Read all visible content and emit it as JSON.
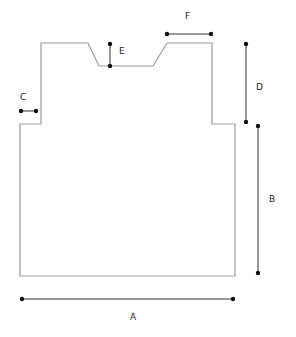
{
  "diagram": {
    "type": "garment schematic",
    "colors": {
      "outline": "#9a9a9a",
      "dimension": "#333333",
      "dot": "#111111"
    },
    "outline_points": [
      [
        41,
        43
      ],
      [
        88,
        43
      ],
      [
        99,
        66
      ],
      [
        153,
        66
      ],
      [
        167,
        43
      ],
      [
        212,
        43
      ],
      [
        212,
        124
      ],
      [
        235,
        124
      ],
      [
        235,
        276
      ],
      [
        20,
        276
      ],
      [
        20,
        124
      ],
      [
        41,
        124
      ]
    ],
    "dimensions": [
      {
        "id": "A",
        "label": "A",
        "x1": 22,
        "y1": 299,
        "x2": 233,
        "y2": 299,
        "lx": 130,
        "ly": 313
      },
      {
        "id": "B",
        "label": "B",
        "x1": 258,
        "y1": 126,
        "x2": 258,
        "y2": 273,
        "lx": 269,
        "ly": 195
      },
      {
        "id": "C",
        "label": "C",
        "x1": 21,
        "y1": 111,
        "x2": 36,
        "y2": 111,
        "lx": 20,
        "ly": 93
      },
      {
        "id": "D",
        "label": "D",
        "x1": 246,
        "y1": 44,
        "x2": 246,
        "y2": 122,
        "lx": 256,
        "ly": 83
      },
      {
        "id": "E",
        "label": "E",
        "x1": 110,
        "y1": 44,
        "x2": 110,
        "y2": 66,
        "lx": 119,
        "ly": 47
      },
      {
        "id": "F",
        "label": "F",
        "x1": 167,
        "y1": 34,
        "x2": 211,
        "y2": 34,
        "lx": 185,
        "ly": 12
      }
    ]
  }
}
